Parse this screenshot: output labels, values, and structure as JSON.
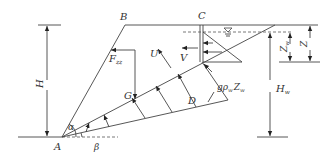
{
  "diagram": {
    "type": "slope-stability-force-diagram",
    "points": {
      "A": "A",
      "B": "B",
      "C": "C",
      "D": "D",
      "G": "G"
    },
    "forces": {
      "U": "U",
      "V": "V",
      "F_zz": "F",
      "F_zz_sub": "zz",
      "pressure": "gρ",
      "pressure_sub": "w",
      "pressure_z": "Z",
      "pressure_z_sub": "w"
    },
    "dimensions": {
      "H": "H",
      "H_w": "H",
      "H_w_sub": "w",
      "Z": "Z",
      "Z_w": "Z",
      "Z_w_sub": "w"
    },
    "angles": {
      "alpha": "α",
      "beta": "β"
    },
    "water_table_symbol": "▽"
  }
}
